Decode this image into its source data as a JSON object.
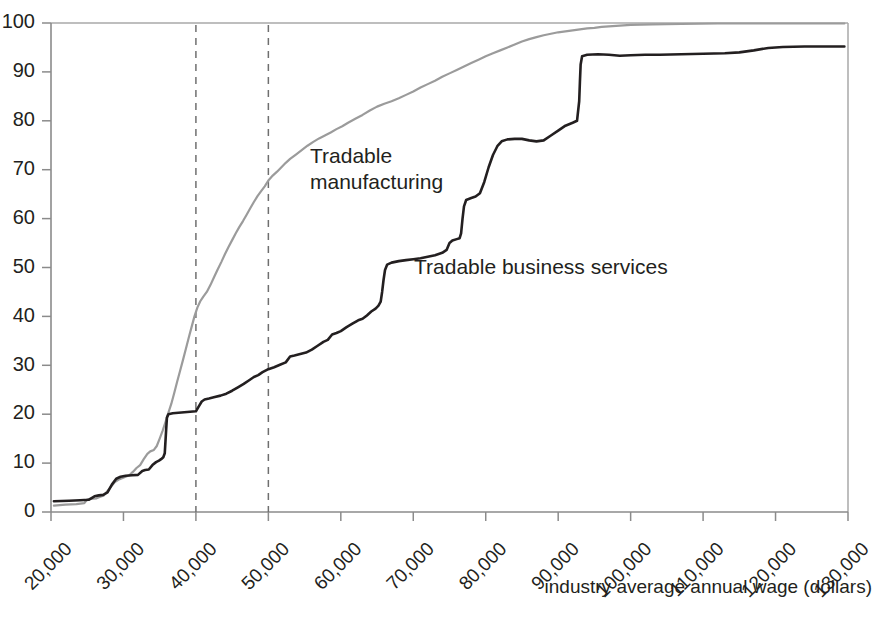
{
  "chart_data": {
    "type": "line",
    "title": "",
    "subtitle": "",
    "xlabel": "industry average annual wage (dollars)",
    "ylabel": "",
    "xlim": [
      20000,
      130000
    ],
    "ylim": [
      0,
      100
    ],
    "grid": false,
    "legend_position": "inline-annotation",
    "x_tick_labels": [
      "20,000",
      "30,000",
      "40,000",
      "50,000",
      "60,000",
      "70,000",
      "80,000",
      "90,000",
      "100,000",
      "110,000",
      "120,000",
      "130,000"
    ],
    "x_tick_values": [
      20000,
      30000,
      40000,
      50000,
      60000,
      70000,
      80000,
      90000,
      100000,
      110000,
      120000,
      130000
    ],
    "y_tick_labels": [
      "0",
      "10",
      "20",
      "30",
      "40",
      "50",
      "60",
      "70",
      "80",
      "90",
      "100"
    ],
    "y_tick_values": [
      0,
      10,
      20,
      30,
      40,
      50,
      60,
      70,
      80,
      90,
      100
    ],
    "annotations": [
      {
        "text": "Tradable manufacturing",
        "line1": "Tradable",
        "line2": "manufacturing",
        "x": 42000,
        "y": 74,
        "series": "Tradable manufacturing"
      },
      {
        "text": "Tradable business services",
        "x": 62500,
        "y": 50,
        "series": "Tradable business services"
      }
    ],
    "reference_lines": [
      {
        "x": 40000,
        "style": "dashed",
        "color": "#6f6f6f"
      },
      {
        "x": 50000,
        "style": "dashed",
        "color": "#6f6f6f"
      }
    ],
    "series": [
      {
        "name": "Tradable manufacturing",
        "color": "#9b9b9b",
        "width": 2.2,
        "points": [
          [
            20400,
            1.3
          ],
          [
            22000,
            1.5
          ],
          [
            23500,
            1.6
          ],
          [
            24600,
            1.8
          ],
          [
            25000,
            2.6
          ],
          [
            25400,
            2.7
          ],
          [
            26300,
            2.8
          ],
          [
            26800,
            3.1
          ],
          [
            27300,
            3.4
          ],
          [
            27800,
            4.3
          ],
          [
            28300,
            5.2
          ],
          [
            28800,
            6.1
          ],
          [
            29300,
            6.6
          ],
          [
            29800,
            6.9
          ],
          [
            30300,
            7.2
          ],
          [
            30800,
            7.5
          ],
          [
            31300,
            8.2
          ],
          [
            31800,
            9.0
          ],
          [
            32300,
            9.6
          ],
          [
            32800,
            10.8
          ],
          [
            33300,
            11.9
          ],
          [
            33700,
            12.4
          ],
          [
            34200,
            12.7
          ],
          [
            34600,
            13.5
          ],
          [
            35000,
            15.0
          ],
          [
            35400,
            16.6
          ],
          [
            35800,
            18.4
          ],
          [
            36200,
            20.3
          ],
          [
            36600,
            22.1
          ],
          [
            37000,
            24.3
          ],
          [
            37400,
            26.6
          ],
          [
            37800,
            28.8
          ],
          [
            38200,
            31.0
          ],
          [
            38600,
            33.3
          ],
          [
            39000,
            35.6
          ],
          [
            39400,
            37.8
          ],
          [
            39800,
            40.0
          ],
          [
            40200,
            41.8
          ],
          [
            40600,
            43.1
          ],
          [
            41000,
            44.0
          ],
          [
            41500,
            45.0
          ],
          [
            42000,
            46.4
          ],
          [
            42500,
            48.0
          ],
          [
            43000,
            49.6
          ],
          [
            43500,
            51.1
          ],
          [
            44000,
            52.7
          ],
          [
            44500,
            54.2
          ],
          [
            45000,
            55.6
          ],
          [
            45500,
            57.0
          ],
          [
            46000,
            58.3
          ],
          [
            46500,
            59.5
          ],
          [
            47000,
            60.8
          ],
          [
            47500,
            62.1
          ],
          [
            48000,
            63.4
          ],
          [
            48500,
            64.6
          ],
          [
            49000,
            65.6
          ],
          [
            49500,
            66.6
          ],
          [
            50000,
            67.8
          ],
          [
            50600,
            68.8
          ],
          [
            51200,
            69.6
          ],
          [
            51800,
            70.5
          ],
          [
            52400,
            71.4
          ],
          [
            53000,
            72.2
          ],
          [
            53800,
            73.1
          ],
          [
            54600,
            74.0
          ],
          [
            55400,
            74.9
          ],
          [
            56200,
            75.7
          ],
          [
            57000,
            76.4
          ],
          [
            57800,
            77.0
          ],
          [
            58600,
            77.6
          ],
          [
            59400,
            78.3
          ],
          [
            60200,
            78.9
          ],
          [
            61000,
            79.6
          ],
          [
            62000,
            80.4
          ],
          [
            63000,
            81.2
          ],
          [
            64000,
            82.1
          ],
          [
            65000,
            82.9
          ],
          [
            66000,
            83.5
          ],
          [
            67000,
            84.0
          ],
          [
            68000,
            84.6
          ],
          [
            69000,
            85.3
          ],
          [
            70000,
            86.0
          ],
          [
            71000,
            86.8
          ],
          [
            72000,
            87.5
          ],
          [
            73000,
            88.2
          ],
          [
            74000,
            89.0
          ],
          [
            75000,
            89.7
          ],
          [
            76000,
            90.4
          ],
          [
            77000,
            91.1
          ],
          [
            78000,
            91.8
          ],
          [
            79000,
            92.5
          ],
          [
            80000,
            93.2
          ],
          [
            81000,
            93.8
          ],
          [
            82000,
            94.4
          ],
          [
            83000,
            95.0
          ],
          [
            84000,
            95.6
          ],
          [
            85000,
            96.2
          ],
          [
            86000,
            96.7
          ],
          [
            87000,
            97.1
          ],
          [
            88000,
            97.5
          ],
          [
            89000,
            97.8
          ],
          [
            90000,
            98.1
          ],
          [
            91000,
            98.3
          ],
          [
            92000,
            98.5
          ],
          [
            93000,
            98.7
          ],
          [
            94000,
            98.9
          ],
          [
            95000,
            99.0
          ],
          [
            96000,
            99.2
          ],
          [
            97000,
            99.3
          ],
          [
            98000,
            99.4
          ],
          [
            100000,
            99.6
          ],
          [
            103000,
            99.7
          ],
          [
            107000,
            99.8
          ],
          [
            112000,
            99.9
          ],
          [
            120000,
            99.9
          ],
          [
            129500,
            99.9
          ]
        ]
      },
      {
        "name": "Tradable business services",
        "color": "#231f20",
        "width": 2.6,
        "points": [
          [
            20400,
            2.2
          ],
          [
            22500,
            2.3
          ],
          [
            24000,
            2.4
          ],
          [
            25200,
            2.5
          ],
          [
            26000,
            3.2
          ],
          [
            26600,
            3.4
          ],
          [
            27200,
            3.5
          ],
          [
            27800,
            4.0
          ],
          [
            28400,
            5.6
          ],
          [
            29000,
            6.8
          ],
          [
            29600,
            7.2
          ],
          [
            30300,
            7.4
          ],
          [
            31200,
            7.5
          ],
          [
            32000,
            7.6
          ],
          [
            32600,
            8.4
          ],
          [
            33000,
            8.6
          ],
          [
            33500,
            8.7
          ],
          [
            34000,
            9.6
          ],
          [
            34500,
            10.2
          ],
          [
            34900,
            10.5
          ],
          [
            35200,
            10.8
          ],
          [
            35500,
            11.2
          ],
          [
            35700,
            12.0
          ],
          [
            35800,
            14.5
          ],
          [
            35900,
            17.0
          ],
          [
            36000,
            19.3
          ],
          [
            36200,
            20.0
          ],
          [
            36800,
            20.2
          ],
          [
            37600,
            20.3
          ],
          [
            38400,
            20.4
          ],
          [
            39200,
            20.5
          ],
          [
            40000,
            20.6
          ],
          [
            40400,
            21.6
          ],
          [
            40800,
            22.6
          ],
          [
            41200,
            23.0
          ],
          [
            41800,
            23.2
          ],
          [
            42600,
            23.5
          ],
          [
            43400,
            23.8
          ],
          [
            44200,
            24.2
          ],
          [
            45000,
            24.8
          ],
          [
            45800,
            25.5
          ],
          [
            46600,
            26.2
          ],
          [
            47400,
            27.0
          ],
          [
            48000,
            27.6
          ],
          [
            48600,
            28.0
          ],
          [
            49200,
            28.6
          ],
          [
            50000,
            29.2
          ],
          [
            50800,
            29.6
          ],
          [
            51600,
            30.1
          ],
          [
            52400,
            30.6
          ],
          [
            53000,
            31.8
          ],
          [
            53600,
            32.0
          ],
          [
            54400,
            32.3
          ],
          [
            55200,
            32.6
          ],
          [
            56000,
            33.2
          ],
          [
            56800,
            34.0
          ],
          [
            57600,
            34.8
          ],
          [
            58200,
            35.2
          ],
          [
            58800,
            36.3
          ],
          [
            59400,
            36.6
          ],
          [
            60000,
            37.0
          ],
          [
            60800,
            37.8
          ],
          [
            61600,
            38.5
          ],
          [
            62400,
            39.2
          ],
          [
            63000,
            39.5
          ],
          [
            63600,
            40.2
          ],
          [
            64200,
            41.0
          ],
          [
            64800,
            41.6
          ],
          [
            65200,
            42.2
          ],
          [
            65500,
            43.0
          ],
          [
            65700,
            45.0
          ],
          [
            65900,
            47.5
          ],
          [
            66100,
            49.5
          ],
          [
            66400,
            50.6
          ],
          [
            67000,
            51.0
          ],
          [
            68000,
            51.3
          ],
          [
            69000,
            51.5
          ],
          [
            70000,
            51.7
          ],
          [
            71000,
            51.9
          ],
          [
            72000,
            52.2
          ],
          [
            73000,
            52.5
          ],
          [
            74000,
            53.0
          ],
          [
            74600,
            53.6
          ],
          [
            75000,
            55.0
          ],
          [
            75400,
            55.5
          ],
          [
            76000,
            55.8
          ],
          [
            76400,
            56.0
          ],
          [
            76600,
            57.0
          ],
          [
            76800,
            60.0
          ],
          [
            77000,
            62.5
          ],
          [
            77300,
            63.8
          ],
          [
            78000,
            64.2
          ],
          [
            78600,
            64.5
          ],
          [
            79200,
            65.2
          ],
          [
            79800,
            67.5
          ],
          [
            80400,
            70.5
          ],
          [
            81000,
            73.0
          ],
          [
            81600,
            74.8
          ],
          [
            82200,
            75.8
          ],
          [
            83000,
            76.2
          ],
          [
            84000,
            76.3
          ],
          [
            85000,
            76.3
          ],
          [
            86000,
            76.0
          ],
          [
            87000,
            75.8
          ],
          [
            88000,
            76.0
          ],
          [
            89000,
            77.0
          ],
          [
            90000,
            78.0
          ],
          [
            91000,
            79.0
          ],
          [
            92000,
            79.6
          ],
          [
            92600,
            80.0
          ],
          [
            92900,
            84.0
          ],
          [
            93000,
            88.0
          ],
          [
            93100,
            91.5
          ],
          [
            93300,
            93.2
          ],
          [
            94000,
            93.5
          ],
          [
            95500,
            93.6
          ],
          [
            97000,
            93.5
          ],
          [
            98500,
            93.3
          ],
          [
            100000,
            93.4
          ],
          [
            102000,
            93.5
          ],
          [
            104000,
            93.5
          ],
          [
            107000,
            93.6
          ],
          [
            110000,
            93.7
          ],
          [
            113000,
            93.8
          ],
          [
            115000,
            94.0
          ],
          [
            117000,
            94.4
          ],
          [
            119000,
            94.9
          ],
          [
            121000,
            95.1
          ],
          [
            124000,
            95.2
          ],
          [
            127000,
            95.2
          ],
          [
            129500,
            95.2
          ]
        ]
      }
    ]
  },
  "axes": {
    "x_axis_label": "industry average annual wage (dollars)"
  }
}
